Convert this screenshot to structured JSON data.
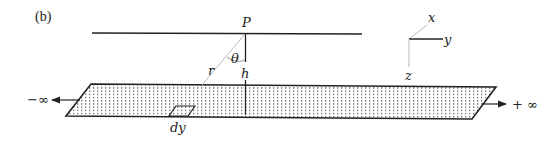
{
  "figure": {
    "panel_label": "(b)",
    "point_label": "P",
    "angle_label": "θ",
    "height_label": "h",
    "distance_label": "r",
    "element_label": "dy",
    "minus_infinity_label": "−∞",
    "plus_infinity_label": "+ ∞",
    "axes": {
      "x_label": "x",
      "y_label": "y",
      "z_label": "z"
    }
  }
}
